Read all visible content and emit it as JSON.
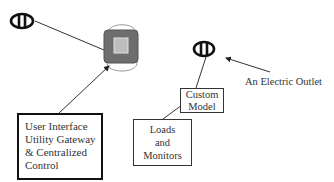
{
  "diagram": {
    "nodes": {
      "ui_gateway": {
        "lines": [
          "User Interface",
          "Utility Gateway",
          "& Centralized",
          "Control"
        ]
      },
      "custom_model": {
        "lines": [
          "Custom",
          "Model"
        ]
      },
      "loads_monitors": {
        "lines": [
          "Loads",
          "and",
          "Monitors"
        ]
      },
      "outlet_label": "An Electric Outlet"
    },
    "icons": {
      "left_outlet": "electric-outlet-icon",
      "right_outlet": "electric-outlet-icon",
      "device": "gateway-device-icon"
    },
    "edges": [
      {
        "from": "left_outlet",
        "to": "device",
        "arrow": false
      },
      {
        "from": "ui_gateway",
        "to": "device",
        "arrow": true
      },
      {
        "from": "right_outlet",
        "to": "custom_model",
        "arrow": false
      },
      {
        "from": "loads_monitors",
        "to": "custom_model",
        "arrow": false
      },
      {
        "from": "outlet_label",
        "to": "right_outlet",
        "arrow": true
      }
    ],
    "colors": {
      "stroke": "#222222",
      "device_dark": "#6e6e6e",
      "device_inner": "#bdbdbd",
      "device_ring": "#9a9a9a"
    }
  }
}
